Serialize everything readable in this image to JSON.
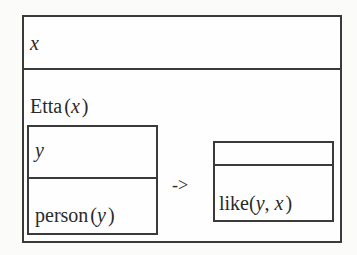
{
  "outer_drs": {
    "universe": "x",
    "conditions": {
      "predicate": {
        "name": "Etta",
        "open": "(",
        "arg": "x",
        "close": ")"
      }
    }
  },
  "antecedent_drs": {
    "universe": "y",
    "condition": {
      "name": "person",
      "open": "(",
      "arg": "y",
      "close": ")"
    }
  },
  "implication_arrow": "->",
  "consequent_drs": {
    "universe": "",
    "condition": {
      "name": "like",
      "open": "(",
      "arg1": "y",
      "sep": ", ",
      "arg2": "x",
      "close": ")"
    }
  },
  "colors": {
    "line": "#3a3a3a",
    "text": "#2a2a2a",
    "background": "#fbfbfa"
  }
}
